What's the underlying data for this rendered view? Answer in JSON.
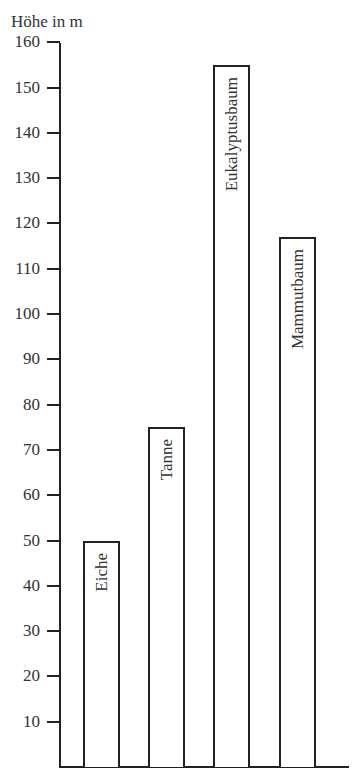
{
  "chart_data": {
    "type": "bar",
    "title": "",
    "xlabel": "",
    "ylabel": "Höhe in m",
    "ylim": [
      0,
      160
    ],
    "yticks": [
      10,
      20,
      30,
      40,
      50,
      60,
      70,
      80,
      90,
      100,
      110,
      120,
      130,
      140,
      150,
      160
    ],
    "ytick_labels": [
      "10",
      "20",
      "30",
      "40",
      "50",
      "60",
      "70",
      "80",
      "90",
      "100",
      "110",
      "120",
      "130",
      "140",
      "150",
      "160"
    ],
    "categories": [
      "Eiche",
      "Tanne",
      "Eukalyptusbaum",
      "Mammutbaum"
    ],
    "values": [
      50,
      75,
      155,
      117
    ],
    "grid": false,
    "legend": null,
    "bar_labels_inside_rotated": true
  },
  "layout": {
    "baseline_y": 767,
    "px_per_unit": 4.53,
    "bars_x": [
      83,
      148,
      213,
      279
    ],
    "bar_width": 37
  }
}
